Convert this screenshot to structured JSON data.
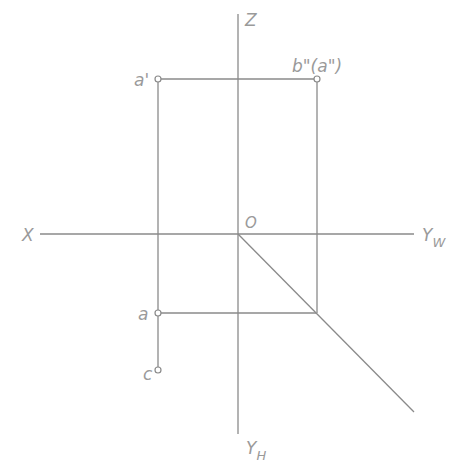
{
  "diagram": {
    "type": "orthographic-projection",
    "colors": {
      "line": "#8a8a8a",
      "label": "#9a9a9a",
      "background": "#ffffff"
    },
    "axes": {
      "x_label": "X",
      "z_label": "Z",
      "yw_label": "Y",
      "yw_sub": "W",
      "yh_label": "Y",
      "yh_sub": "H",
      "origin_label": "O"
    },
    "points": {
      "a_prime": "a'",
      "b_dprime_a_dprime": "b\"(a\")",
      "a": "a",
      "c": "c"
    }
  }
}
